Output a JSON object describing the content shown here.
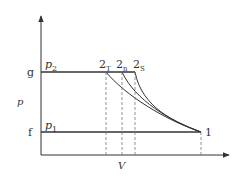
{
  "diagram": {
    "axes": {
      "y_label": "p",
      "x_label": "V"
    },
    "levels": {
      "upper": {
        "tick": "g",
        "pressure": "p",
        "pressure_sub": "2"
      },
      "lower": {
        "tick": "f",
        "pressure": "p",
        "pressure_sub": "1"
      }
    },
    "points": {
      "start": {
        "label": "1"
      },
      "end_isothermal": {
        "label": "2",
        "sub": "T"
      },
      "end_polytropic": {
        "label": "2",
        "sub": "n"
      },
      "end_isentropic": {
        "label": "2",
        "sub": "S"
      }
    },
    "colors": {
      "line": "#333333",
      "dashed": "#777777"
    }
  }
}
